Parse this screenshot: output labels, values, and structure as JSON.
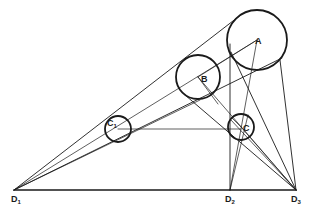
{
  "diagram": {
    "type": "geometric-construction",
    "stroke_color": "#1a1a1a",
    "background": "#ffffff",
    "circles": [
      {
        "id": "A",
        "label": "A",
        "cx": 257,
        "cy": 40,
        "r": 30
      },
      {
        "id": "B",
        "label": "B",
        "cx": 198,
        "cy": 77,
        "r": 22
      },
      {
        "id": "C",
        "label": "C",
        "cx": 241,
        "cy": 127,
        "r": 13
      },
      {
        "id": "C1",
        "label": "C",
        "sub": "1",
        "cx": 118,
        "cy": 129,
        "r": 13
      }
    ],
    "points": [
      {
        "id": "D1",
        "label": "D",
        "sub": "1",
        "x": 14,
        "y": 190
      },
      {
        "id": "D2",
        "label": "D",
        "sub": "2",
        "x": 230,
        "y": 190
      },
      {
        "id": "D3",
        "label": "D",
        "sub": "3",
        "x": 296,
        "y": 190
      }
    ],
    "labels": {
      "A": "A",
      "B": "B",
      "C": "C",
      "C1_main": "C",
      "C1_sub": "1",
      "D1_main": "D",
      "D1_sub": "1",
      "D2_main": "D",
      "D2_sub": "2",
      "D3_main": "D",
      "D3_sub": "3"
    }
  }
}
